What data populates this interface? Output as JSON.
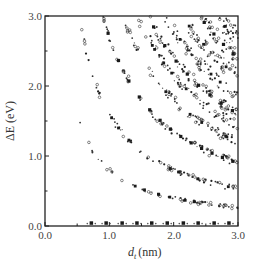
{
  "chart_data": {
    "type": "scatter",
    "title": "",
    "xlabel": "d_t (nm)",
    "xlabel_main": "d",
    "xlabel_sub": "t",
    "xlabel_unit": "(nm)",
    "ylabel": "ΔE (eV)",
    "xlim": [
      0.0,
      3.0
    ],
    "ylim": [
      0.0,
      3.0
    ],
    "x_ticks": [
      "0.0",
      "1.0",
      "2.0",
      "3.0"
    ],
    "y_ticks": [
      "0.0",
      "1.0",
      "2.0",
      "3.0"
    ],
    "grid": false,
    "legend": "none",
    "series": [
      {
        "name": "metallic (zero gap)",
        "marker": "square",
        "k": 0.0,
        "points": [
          [
            0.72,
            0.02
          ],
          [
            0.95,
            0.02
          ],
          [
            1.2,
            0.02
          ],
          [
            1.43,
            0.02
          ],
          [
            1.66,
            0.02
          ],
          [
            1.9,
            0.02
          ],
          [
            2.15,
            0.02
          ],
          [
            2.38,
            0.02
          ],
          [
            2.63,
            0.02
          ],
          [
            2.86,
            0.02
          ]
        ]
      },
      {
        "name": "band 1",
        "marker": "dot",
        "k": 0.8,
        "d_range": [
          0.55,
          3.0
        ],
        "sample_points": [
          [
            1.0,
            0.8
          ],
          [
            2.0,
            0.4
          ],
          [
            3.0,
            0.27
          ]
        ]
      },
      {
        "name": "band 2",
        "marker": "dot",
        "k": 1.6,
        "d_range": [
          0.55,
          3.0
        ],
        "sample_points": [
          [
            1.0,
            1.6
          ],
          [
            2.0,
            0.8
          ],
          [
            3.0,
            0.54
          ]
        ]
      },
      {
        "name": "band 3 (metallic M11)",
        "marker": "square",
        "k": 2.7,
        "d_range": [
          0.9,
          3.0
        ],
        "sample_points": [
          [
            1.0,
            2.7
          ],
          [
            2.0,
            1.35
          ],
          [
            3.0,
            0.91
          ]
        ]
      },
      {
        "name": "band 4",
        "marker": "dot",
        "k": 3.6,
        "d_range": [
          1.2,
          3.0
        ],
        "sample_points": [
          [
            1.5,
            2.4
          ],
          [
            2.0,
            1.8
          ],
          [
            3.0,
            1.21
          ]
        ]
      },
      {
        "name": "band 5",
        "marker": "dot",
        "k": 4.3,
        "d_range": [
          1.45,
          3.0
        ],
        "sample_points": [
          [
            2.0,
            2.15
          ],
          [
            3.0,
            1.43
          ]
        ]
      },
      {
        "name": "band 6",
        "marker": "square",
        "k": 4.8,
        "d_range": [
          1.6,
          3.0
        ],
        "sample_points": [
          [
            2.0,
            2.4
          ],
          [
            3.0,
            1.61
          ]
        ]
      },
      {
        "name": "band 7",
        "marker": "dot",
        "k": 5.6,
        "d_range": [
          1.87,
          3.0
        ],
        "sample_points": [
          [
            2.0,
            2.8
          ],
          [
            3.0,
            1.87
          ]
        ]
      },
      {
        "name": "band 8",
        "marker": "dot",
        "k": 6.4,
        "d_range": [
          2.15,
          3.0
        ],
        "sample_points": [
          [
            2.5,
            2.56
          ],
          [
            3.0,
            2.13
          ]
        ]
      },
      {
        "name": "band 9",
        "marker": "square",
        "k": 7.2,
        "d_range": [
          2.4,
          3.0
        ],
        "sample_points": [
          [
            2.5,
            2.88
          ],
          [
            3.0,
            2.4
          ]
        ]
      },
      {
        "name": "band 10",
        "marker": "dot",
        "k": 8.0,
        "d_range": [
          2.67,
          3.0
        ],
        "sample_points": [
          [
            3.0,
            2.67
          ]
        ]
      },
      {
        "name": "band 11",
        "marker": "dot",
        "k": 8.6,
        "d_range": [
          2.87,
          3.0
        ],
        "sample_points": [
          [
            3.0,
            2.87
          ]
        ]
      }
    ]
  }
}
